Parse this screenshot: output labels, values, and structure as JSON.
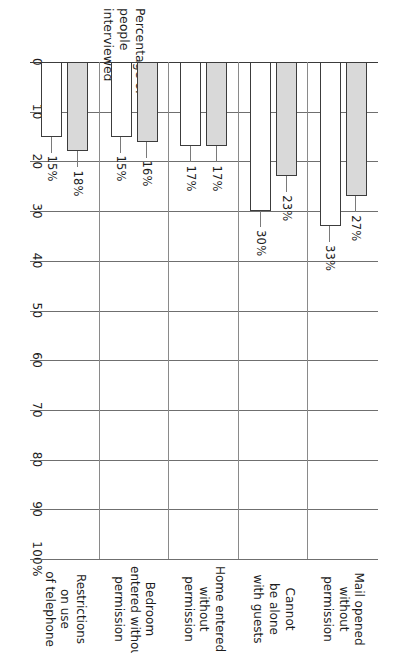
{
  "chart_data": {
    "type": "bar",
    "orientation": "horizontal",
    "title": "",
    "xlabel": "Percentage of people interviewed",
    "ylabel": "",
    "xlim": [
      0,
      100
    ],
    "grid": true,
    "legend": false,
    "tick_labels": [
      "0",
      "10",
      "20",
      "30",
      "40",
      "50",
      "60",
      "70",
      "80",
      "90",
      "100%"
    ],
    "tick_values": [
      0,
      10,
      20,
      30,
      40,
      50,
      60,
      70,
      80,
      90,
      100
    ],
    "categories": [
      "Restrictions on use of telephone",
      "Bedroom entered without permission",
      "Home entered without permission",
      "Cannot be alone with guests",
      "Mail opened without permission"
    ],
    "category_lines": [
      [
        "Restrictions",
        "on use",
        "of telephone"
      ],
      [
        "Bedroom",
        "entered without",
        "permission"
      ],
      [
        "Home entered",
        "without",
        "permission"
      ],
      [
        "Cannot",
        "be alone",
        "with guests"
      ],
      [
        "Mail opened",
        "without",
        "permission"
      ]
    ],
    "series": [
      {
        "name": "series-1",
        "fill": "#ffffff",
        "values": [
          15,
          15,
          17,
          30,
          33
        ],
        "labels": [
          "15%",
          "15%",
          "17%",
          "30%",
          "33%"
        ]
      },
      {
        "name": "series-2",
        "fill": "#d9d9d9",
        "values": [
          18,
          16,
          17,
          23,
          27
        ],
        "labels": [
          "18%",
          "16%",
          "17%",
          "23%",
          "27%"
        ]
      }
    ]
  },
  "axis_title_lines": [
    "Percentage of",
    "people",
    "interviewed"
  ],
  "colors": {
    "bar_outline": "#3c3c3c",
    "bar_fill_white": "#ffffff",
    "bar_fill_gray": "#d9d9d9",
    "gridline": "#6f6f6f",
    "text": "#1d1d1d",
    "background": "#ffffff"
  }
}
